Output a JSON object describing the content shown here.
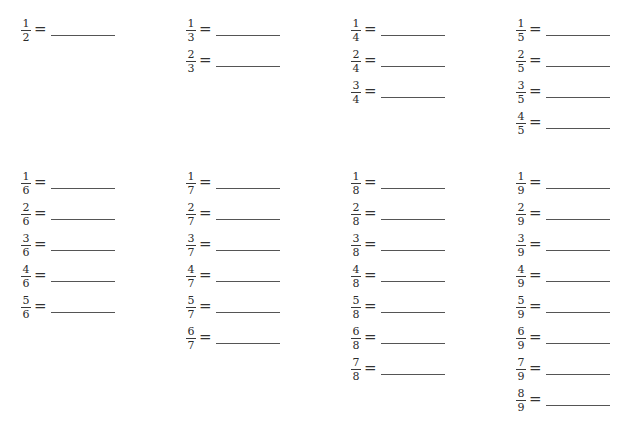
{
  "worksheet": {
    "header_clipped": true,
    "equals_symbol": "=",
    "top_section": {
      "groups": [
        {
          "denominator": "2",
          "items": [
            {
              "numerator": "1",
              "denominator": "2",
              "answer": ""
            }
          ]
        },
        {
          "denominator": "3",
          "items": [
            {
              "numerator": "1",
              "denominator": "3",
              "answer": ""
            },
            {
              "numerator": "2",
              "denominator": "3",
              "answer": ""
            }
          ]
        },
        {
          "denominator": "4",
          "items": [
            {
              "numerator": "1",
              "denominator": "4",
              "answer": ""
            },
            {
              "numerator": "2",
              "denominator": "4",
              "answer": ""
            },
            {
              "numerator": "3",
              "denominator": "4",
              "answer": ""
            }
          ]
        },
        {
          "denominator": "5",
          "items": [
            {
              "numerator": "1",
              "denominator": "5",
              "answer": ""
            },
            {
              "numerator": "2",
              "denominator": "5",
              "answer": ""
            },
            {
              "numerator": "3",
              "denominator": "5",
              "answer": ""
            },
            {
              "numerator": "4",
              "denominator": "5",
              "answer": ""
            }
          ]
        }
      ]
    },
    "bottom_section": {
      "groups": [
        {
          "denominator": "6",
          "items": [
            {
              "numerator": "1",
              "denominator": "6",
              "answer": ""
            },
            {
              "numerator": "2",
              "denominator": "6",
              "answer": ""
            },
            {
              "numerator": "3",
              "denominator": "6",
              "answer": ""
            },
            {
              "numerator": "4",
              "denominator": "6",
              "answer": ""
            },
            {
              "numerator": "5",
              "denominator": "6",
              "answer": ""
            }
          ]
        },
        {
          "denominator": "7",
          "items": [
            {
              "numerator": "1",
              "denominator": "7",
              "answer": ""
            },
            {
              "numerator": "2",
              "denominator": "7",
              "answer": ""
            },
            {
              "numerator": "3",
              "denominator": "7",
              "answer": ""
            },
            {
              "numerator": "4",
              "denominator": "7",
              "answer": ""
            },
            {
              "numerator": "5",
              "denominator": "7",
              "answer": ""
            },
            {
              "numerator": "6",
              "denominator": "7",
              "answer": ""
            }
          ]
        },
        {
          "denominator": "8",
          "items": [
            {
              "numerator": "1",
              "denominator": "8",
              "answer": ""
            },
            {
              "numerator": "2",
              "denominator": "8",
              "answer": ""
            },
            {
              "numerator": "3",
              "denominator": "8",
              "answer": ""
            },
            {
              "numerator": "4",
              "denominator": "8",
              "answer": ""
            },
            {
              "numerator": "5",
              "denominator": "8",
              "answer": ""
            },
            {
              "numerator": "6",
              "denominator": "8",
              "answer": ""
            },
            {
              "numerator": "7",
              "denominator": "8",
              "answer": ""
            }
          ]
        },
        {
          "denominator": "9",
          "items": [
            {
              "numerator": "1",
              "denominator": "9",
              "answer": ""
            },
            {
              "numerator": "2",
              "denominator": "9",
              "answer": ""
            },
            {
              "numerator": "3",
              "denominator": "9",
              "answer": ""
            },
            {
              "numerator": "4",
              "denominator": "9",
              "answer": ""
            },
            {
              "numerator": "5",
              "denominator": "9",
              "answer": ""
            },
            {
              "numerator": "6",
              "denominator": "9",
              "answer": ""
            },
            {
              "numerator": "7",
              "denominator": "9",
              "answer": ""
            },
            {
              "numerator": "8",
              "denominator": "9",
              "answer": ""
            }
          ]
        }
      ]
    },
    "colors": {
      "text": "#2b2b2b",
      "answer_line": "#555555",
      "background": "#ffffff"
    }
  }
}
